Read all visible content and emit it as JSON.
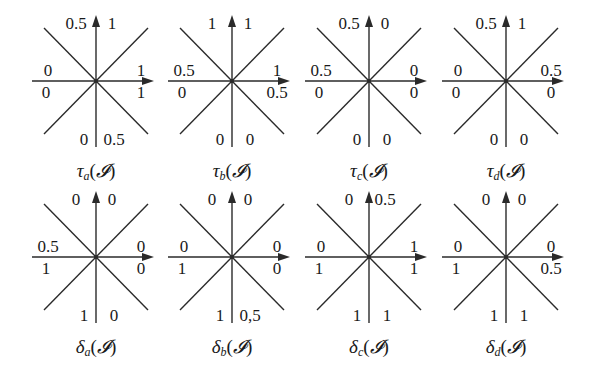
{
  "figure": {
    "layout": {
      "columns_x": [
        96,
        232,
        369,
        506
      ],
      "rows_y": [
        81,
        257
      ],
      "caption_offset_y": 92
    },
    "stroke_color": "#2a2a2a",
    "panels": [
      {
        "id": "tau_a",
        "symbol": "τ",
        "subscript": "a",
        "argument": "𝓘",
        "row": 0,
        "col": 0,
        "values": {
          "top_left": "0.5",
          "top_right": "1",
          "right_upper": "1",
          "right_lower": "1",
          "bottom_right": "0.5",
          "bottom_left": "0",
          "left_lower": "0",
          "left_upper": "0"
        }
      },
      {
        "id": "tau_b",
        "symbol": "τ",
        "subscript": "b",
        "argument": "𝓘",
        "row": 0,
        "col": 1,
        "values": {
          "top_left": "1",
          "top_right": "1",
          "right_upper": "1",
          "right_lower": "0.5",
          "bottom_right": "0",
          "bottom_left": "0",
          "left_lower": "0",
          "left_upper": "0.5"
        }
      },
      {
        "id": "tau_c",
        "symbol": "τ",
        "subscript": "c",
        "argument": "𝓘",
        "row": 0,
        "col": 2,
        "values": {
          "top_left": "0.5",
          "top_right": "0",
          "right_upper": "0",
          "right_lower": "0",
          "bottom_right": "0",
          "bottom_left": "0",
          "left_lower": "0",
          "left_upper": "0.5"
        }
      },
      {
        "id": "tau_d",
        "symbol": "τ",
        "subscript": "d",
        "argument": "𝓘",
        "row": 0,
        "col": 3,
        "values": {
          "top_left": "0.5",
          "top_right": "1",
          "right_upper": "0.5",
          "right_lower": "0",
          "bottom_right": "0",
          "bottom_left": "0",
          "left_lower": "0",
          "left_upper": "0"
        }
      },
      {
        "id": "delta_a",
        "symbol": "δ",
        "subscript": "a",
        "argument": "𝓘",
        "row": 1,
        "col": 0,
        "values": {
          "top_left": "0",
          "top_right": "0",
          "right_upper": "0",
          "right_lower": "0",
          "bottom_right": "0",
          "bottom_left": "1",
          "left_lower": "1",
          "left_upper": "0.5"
        }
      },
      {
        "id": "delta_b",
        "symbol": "δ",
        "subscript": "b",
        "argument": "𝓘",
        "row": 1,
        "col": 1,
        "values": {
          "top_left": "0",
          "top_right": "0",
          "right_upper": "0",
          "right_lower": "0",
          "bottom_right": "0,5",
          "bottom_left": "1",
          "left_lower": "1",
          "left_upper": "0"
        }
      },
      {
        "id": "delta_c",
        "symbol": "δ",
        "subscript": "c",
        "argument": "𝓘",
        "row": 1,
        "col": 2,
        "values": {
          "top_left": "0",
          "top_right": "0.5",
          "right_upper": "1",
          "right_lower": "1",
          "bottom_right": "1",
          "bottom_left": "1",
          "left_lower": "1",
          "left_upper": "0"
        }
      },
      {
        "id": "delta_d",
        "symbol": "δ",
        "subscript": "d",
        "argument": "𝓘",
        "row": 1,
        "col": 3,
        "values": {
          "top_left": "0",
          "top_right": "0",
          "right_upper": "0",
          "right_lower": "0.5",
          "bottom_right": "1",
          "bottom_left": "1",
          "left_lower": "1",
          "left_upper": "0"
        }
      }
    ]
  }
}
